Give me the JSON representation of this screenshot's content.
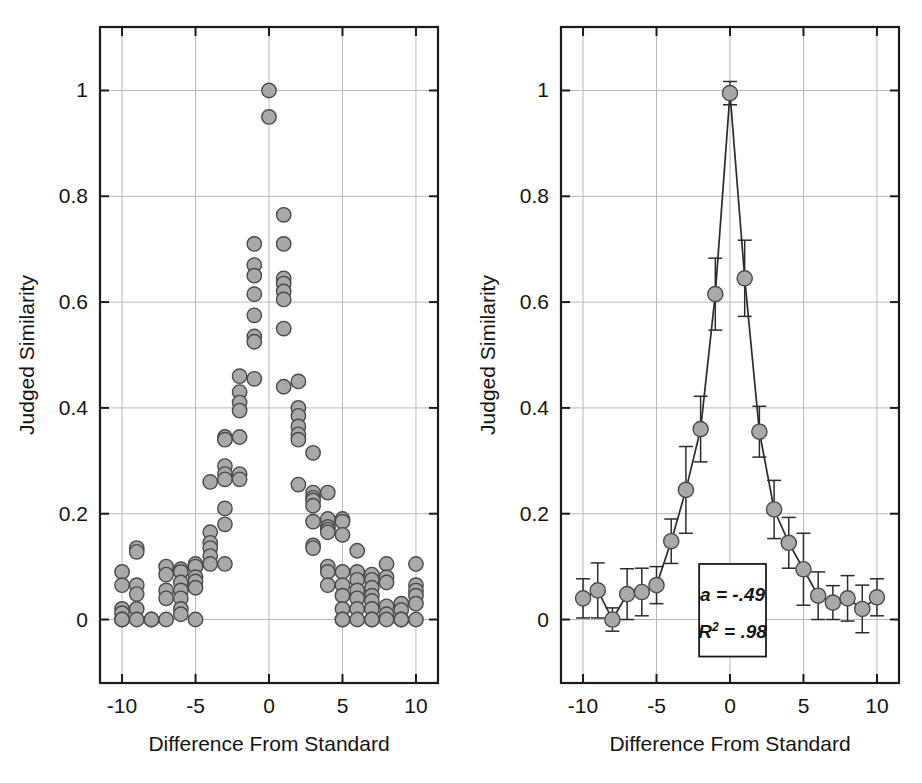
{
  "figure": {
    "panels": [
      {
        "id": "left",
        "name": "individual-observations-scatter",
        "xlabel": "Difference From Standard",
        "ylabel": "Judged Similarity",
        "xticks": [
          "-10",
          "-5",
          "0",
          "5",
          "10"
        ],
        "yticks": [
          "0",
          "0.2",
          "0.4",
          "0.6",
          "0.8",
          "1"
        ]
      },
      {
        "id": "right",
        "name": "mean-similarity-with-fit",
        "xlabel": "Difference From Standard",
        "ylabel": "Judged Similarity",
        "xticks": [
          "-10",
          "-5",
          "0",
          "5",
          "10"
        ],
        "yticks": [
          "0",
          "0.2",
          "0.4",
          "0.6",
          "0.8",
          "1"
        ],
        "annotation": {
          "line1": "a = -.49",
          "line2_base": "R",
          "line2_sup": "2",
          "line2_rest": " = .98"
        }
      }
    ],
    "colors": {
      "marker_fill": "#a9a9a9",
      "marker_stroke": "#4a4a4a",
      "axis": "#1a1a1a",
      "grid": "#b8b8b8",
      "curve": "#2b2b2b"
    }
  },
  "chart_data": [
    {
      "type": "scatter",
      "title": "",
      "panel": "left",
      "xlabel": "Difference From Standard",
      "ylabel": "Judged Similarity",
      "xlim": [
        -11.5,
        11.5
      ],
      "ylim": [
        -0.12,
        1.12
      ],
      "xticks": [
        -10,
        -5,
        0,
        5,
        10
      ],
      "yticks": [
        0,
        0.2,
        0.4,
        0.6,
        0.8,
        1
      ],
      "grid": true,
      "legend": "none",
      "points": [
        [
          -10,
          0.09
        ],
        [
          -10,
          0.065
        ],
        [
          -10,
          0.02
        ],
        [
          -10,
          0.012
        ],
        [
          -10,
          0.0
        ],
        [
          -10,
          0.0
        ],
        [
          -9,
          0.135
        ],
        [
          -9,
          0.128
        ],
        [
          -9,
          0.065
        ],
        [
          -9,
          0.048
        ],
        [
          -9,
          0.02
        ],
        [
          -9,
          0.0
        ],
        [
          -8,
          0.0
        ],
        [
          -8,
          0.0
        ],
        [
          -7,
          0.1
        ],
        [
          -7,
          0.085
        ],
        [
          -7,
          0.055
        ],
        [
          -7,
          0.04
        ],
        [
          -7,
          0.0
        ],
        [
          -6,
          0.095
        ],
        [
          -6,
          0.09
        ],
        [
          -6,
          0.07
        ],
        [
          -6,
          0.055
        ],
        [
          -6,
          0.04
        ],
        [
          -6,
          0.02
        ],
        [
          -6,
          0.01
        ],
        [
          -5,
          0.105
        ],
        [
          -5,
          0.1
        ],
        [
          -5,
          0.08
        ],
        [
          -5,
          0.072
        ],
        [
          -5,
          0.06
        ],
        [
          -5,
          0.0
        ],
        [
          -4,
          0.26
        ],
        [
          -4,
          0.165
        ],
        [
          -4,
          0.145
        ],
        [
          -4,
          0.135
        ],
        [
          -4,
          0.12
        ],
        [
          -4,
          0.105
        ],
        [
          -3,
          0.345
        ],
        [
          -3,
          0.34
        ],
        [
          -3,
          0.29
        ],
        [
          -3,
          0.275
        ],
        [
          -3,
          0.265
        ],
        [
          -3,
          0.21
        ],
        [
          -3,
          0.18
        ],
        [
          -3,
          0.105
        ],
        [
          -2,
          0.46
        ],
        [
          -2,
          0.43
        ],
        [
          -2,
          0.41
        ],
        [
          -2,
          0.395
        ],
        [
          -2,
          0.345
        ],
        [
          -2,
          0.275
        ],
        [
          -2,
          0.265
        ],
        [
          -1,
          0.71
        ],
        [
          -1,
          0.67
        ],
        [
          -1,
          0.65
        ],
        [
          -1,
          0.615
        ],
        [
          -1,
          0.575
        ],
        [
          -1,
          0.535
        ],
        [
          -1,
          0.525
        ],
        [
          -1,
          0.455
        ],
        [
          0,
          1.0
        ],
        [
          0,
          0.95
        ],
        [
          1,
          0.765
        ],
        [
          1,
          0.71
        ],
        [
          1,
          0.645
        ],
        [
          1,
          0.635
        ],
        [
          1,
          0.62
        ],
        [
          1,
          0.605
        ],
        [
          1,
          0.55
        ],
        [
          1,
          0.44
        ],
        [
          2,
          0.45
        ],
        [
          2,
          0.4
        ],
        [
          2,
          0.385
        ],
        [
          2,
          0.365
        ],
        [
          2,
          0.35
        ],
        [
          2,
          0.34
        ],
        [
          2,
          0.255
        ],
        [
          3,
          0.315
        ],
        [
          3,
          0.24
        ],
        [
          3,
          0.23
        ],
        [
          3,
          0.225
        ],
        [
          3,
          0.215
        ],
        [
          3,
          0.185
        ],
        [
          3,
          0.14
        ],
        [
          3,
          0.135
        ],
        [
          4,
          0.24
        ],
        [
          4,
          0.19
        ],
        [
          4,
          0.175
        ],
        [
          4,
          0.17
        ],
        [
          4,
          0.165
        ],
        [
          4,
          0.1
        ],
        [
          4,
          0.09
        ],
        [
          4,
          0.065
        ],
        [
          5,
          0.19
        ],
        [
          5,
          0.185
        ],
        [
          5,
          0.16
        ],
        [
          5,
          0.09
        ],
        [
          5,
          0.065
        ],
        [
          5,
          0.045
        ],
        [
          5,
          0.02
        ],
        [
          5,
          0.0
        ],
        [
          5,
          0.0
        ],
        [
          6,
          0.13
        ],
        [
          6,
          0.09
        ],
        [
          6,
          0.075
        ],
        [
          6,
          0.055
        ],
        [
          6,
          0.04
        ],
        [
          6,
          0.02
        ],
        [
          6,
          0.0
        ],
        [
          7,
          0.085
        ],
        [
          7,
          0.075
        ],
        [
          7,
          0.06
        ],
        [
          7,
          0.045
        ],
        [
          7,
          0.035
        ],
        [
          7,
          0.02
        ],
        [
          7,
          0.0
        ],
        [
          7,
          0.0
        ],
        [
          8,
          0.105
        ],
        [
          8,
          0.08
        ],
        [
          8,
          0.07
        ],
        [
          8,
          0.025
        ],
        [
          8,
          0.01
        ],
        [
          8,
          0.0
        ],
        [
          9,
          0.03
        ],
        [
          9,
          0.018
        ],
        [
          9,
          0.0
        ],
        [
          9,
          0.0
        ],
        [
          10,
          0.105
        ],
        [
          10,
          0.065
        ],
        [
          10,
          0.055
        ],
        [
          10,
          0.045
        ],
        [
          10,
          0.03
        ],
        [
          10,
          0.0
        ]
      ]
    },
    {
      "type": "line",
      "panel": "right",
      "title": "",
      "xlabel": "Difference From Standard",
      "ylabel": "Judged Similarity",
      "xlim": [
        -11.5,
        11.5
      ],
      "ylim": [
        -0.12,
        1.12
      ],
      "xticks": [
        -10,
        -5,
        0,
        5,
        10
      ],
      "yticks": [
        0,
        0.2,
        0.4,
        0.6,
        0.8,
        1
      ],
      "grid": true,
      "legend": "none",
      "x": [
        -10,
        -9,
        -8,
        -7,
        -6,
        -5,
        -4,
        -3,
        -2,
        -1,
        0,
        1,
        2,
        3,
        4,
        5,
        6,
        7,
        8,
        9,
        10
      ],
      "values": [
        0.04,
        0.055,
        0.0,
        0.048,
        0.052,
        0.065,
        0.148,
        0.245,
        0.36,
        0.615,
        0.995,
        0.645,
        0.355,
        0.208,
        0.145,
        0.095,
        0.045,
        0.032,
        0.04,
        0.02,
        0.042
      ],
      "errors": [
        0.037,
        0.052,
        0.022,
        0.048,
        0.045,
        0.035,
        0.042,
        0.082,
        0.062,
        0.068,
        0.022,
        0.072,
        0.048,
        0.055,
        0.048,
        0.068,
        0.045,
        0.032,
        0.043,
        0.045,
        0.035
      ],
      "fit": {
        "label": "exponential decay fit",
        "a": -0.49,
        "r_squared": 0.98,
        "annotation_lines": [
          "a = -.49",
          "R^2 = .98"
        ]
      }
    }
  ]
}
